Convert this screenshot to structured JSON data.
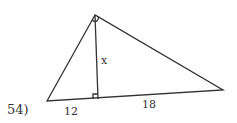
{
  "problem": {
    "number_label": "54)",
    "labels": {
      "altitude": "x",
      "left_segment": "12",
      "right_segment": "18"
    },
    "vertices": {
      "top": [
        95,
        15
      ],
      "left": [
        47,
        101
      ],
      "right": [
        223,
        90
      ],
      "altitude_foot": [
        98,
        99
      ]
    },
    "marks": [
      "right-angle at top vertex",
      "right-angle at altitude foot"
    ],
    "stroke_color": "#333333"
  }
}
